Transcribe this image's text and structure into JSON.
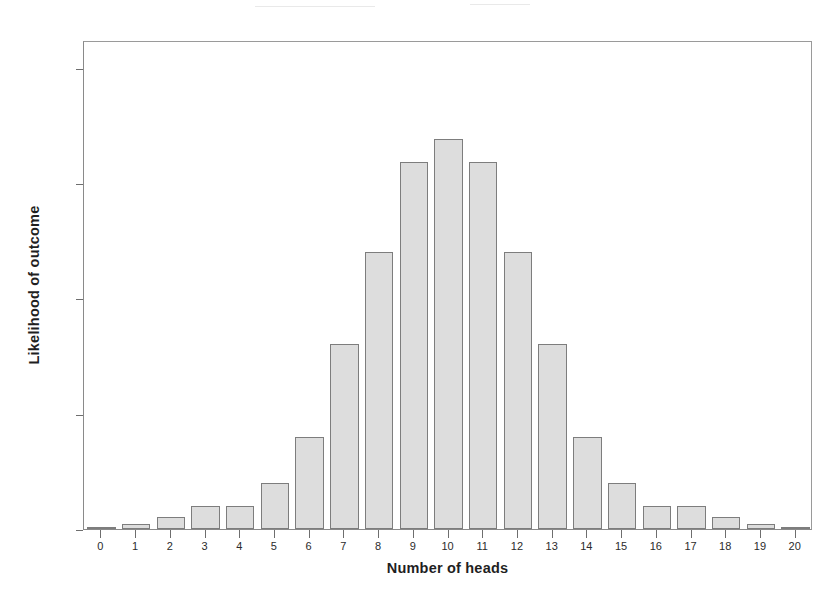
{
  "chart_data": {
    "type": "bar",
    "title": "",
    "subtitle": "",
    "xlabel": "Number of heads",
    "ylabel": "Likelihood of outcome",
    "categories": [
      "0",
      "1",
      "2",
      "3",
      "4",
      "5",
      "6",
      "7",
      "8",
      "9",
      "10",
      "11",
      "12",
      "13",
      "14",
      "15",
      "16",
      "17",
      "18",
      "19",
      "20"
    ],
    "values": [
      0.02,
      0.2,
      0.5,
      1.0,
      1.0,
      2.0,
      4.0,
      8.0,
      12.0,
      15.9,
      16.9,
      15.9,
      12.0,
      8.0,
      4.0,
      2.0,
      1.0,
      1.0,
      0.5,
      0.2,
      0.02
    ],
    "xlim": [
      -0.5,
      20.5
    ],
    "ylim": [
      0,
      21.2
    ],
    "yticks": [
      0,
      5,
      10,
      15,
      20
    ],
    "ytick_labels": [
      "0",
      "5",
      "10",
      "15",
      "20"
    ],
    "xtick_labels": [
      "0",
      "1",
      "2",
      "3",
      "4",
      "5",
      "6",
      "7",
      "8",
      "9",
      "10",
      "11",
      "12",
      "13",
      "14",
      "15",
      "16",
      "17",
      "18",
      "19",
      "20"
    ],
    "grid": false,
    "legend": null,
    "legend_position": "none",
    "bar_fill_color": "#dddddd",
    "bar_edge_color": "#7d7d7d",
    "axis_color": "#8a8a8a",
    "text_color": "#1f1f1f",
    "background_color": "#ffffff",
    "annotations": []
  }
}
